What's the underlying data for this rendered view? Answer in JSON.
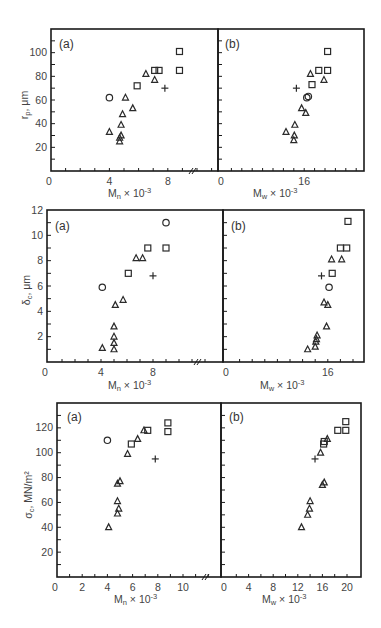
{
  "chart_data": [
    {
      "type": "scatter",
      "row": "top",
      "ylabel": "r_p, μm",
      "ylim": [
        0,
        120
      ],
      "yticks": [
        20,
        40,
        60,
        80,
        100
      ],
      "panels": [
        {
          "label": "(a)",
          "xlabel": "M_n × 10^-3",
          "xlim": [
            0,
            12
          ],
          "xticks": [
            0,
            4,
            8
          ],
          "axis_break": true,
          "points": [
            {
              "x": 4.0,
              "y": 62,
              "marker": "circle"
            },
            {
              "x": 4.0,
              "y": 33,
              "marker": "triangle"
            },
            {
              "x": 4.7,
              "y": 25,
              "marker": "triangle"
            },
            {
              "x": 4.7,
              "y": 28,
              "marker": "triangle"
            },
            {
              "x": 4.8,
              "y": 30,
              "marker": "triangle"
            },
            {
              "x": 4.8,
              "y": 39,
              "marker": "triangle"
            },
            {
              "x": 4.9,
              "y": 48,
              "marker": "triangle"
            },
            {
              "x": 5.1,
              "y": 62,
              "marker": "triangle"
            },
            {
              "x": 5.6,
              "y": 53,
              "marker": "triangle"
            },
            {
              "x": 5.9,
              "y": 72,
              "marker": "square"
            },
            {
              "x": 6.5,
              "y": 82,
              "marker": "triangle"
            },
            {
              "x": 7.1,
              "y": 77,
              "marker": "triangle"
            },
            {
              "x": 7.1,
              "y": 85,
              "marker": "square"
            },
            {
              "x": 7.4,
              "y": 85,
              "marker": "square"
            },
            {
              "x": 7.8,
              "y": 70,
              "marker": "plus"
            },
            {
              "x": 8.8,
              "y": 101,
              "marker": "square"
            },
            {
              "x": 8.8,
              "y": 85,
              "marker": "square"
            }
          ]
        },
        {
          "label": "(b)",
          "xlabel": "M_w × 10^-3",
          "xlim": [
            0,
            24
          ],
          "xticks": [
            0,
            16
          ],
          "points": [
            {
              "x": 12.5,
              "y": 33,
              "marker": "triangle"
            },
            {
              "x": 14.0,
              "y": 26,
              "marker": "triangle"
            },
            {
              "x": 14.1,
              "y": 30,
              "marker": "triangle"
            },
            {
              "x": 14.2,
              "y": 39,
              "marker": "triangle"
            },
            {
              "x": 14.5,
              "y": 70,
              "marker": "plus"
            },
            {
              "x": 15.5,
              "y": 53,
              "marker": "triangle"
            },
            {
              "x": 16.3,
              "y": 49,
              "marker": "triangle"
            },
            {
              "x": 16.5,
              "y": 62,
              "marker": "circle"
            },
            {
              "x": 16.8,
              "y": 63,
              "marker": "circle"
            },
            {
              "x": 17.2,
              "y": 82,
              "marker": "triangle"
            },
            {
              "x": 17.5,
              "y": 73,
              "marker": "square"
            },
            {
              "x": 18.8,
              "y": 85,
              "marker": "square"
            },
            {
              "x": 19.8,
              "y": 77,
              "marker": "triangle"
            },
            {
              "x": 20.5,
              "y": 101,
              "marker": "square"
            },
            {
              "x": 20.5,
              "y": 85,
              "marker": "square"
            }
          ]
        }
      ]
    },
    {
      "type": "scatter",
      "row": "middle",
      "ylabel": "δ_c, μm",
      "ylim": [
        0,
        12
      ],
      "yticks": [
        2,
        4,
        6,
        8,
        10,
        12
      ],
      "panels": [
        {
          "label": "(a)",
          "xlabel": "M_n × 10^-3",
          "xlim": [
            0,
            12
          ],
          "xticks": [
            0,
            4,
            8
          ],
          "axis_break": true,
          "points": [
            {
              "x": 4.1,
              "y": 5.9,
              "marker": "circle"
            },
            {
              "x": 4.1,
              "y": 1.1,
              "marker": "triangle"
            },
            {
              "x": 5.0,
              "y": 1.0,
              "marker": "triangle"
            },
            {
              "x": 5.0,
              "y": 1.5,
              "marker": "triangle"
            },
            {
              "x": 5.0,
              "y": 2.0,
              "marker": "triangle"
            },
            {
              "x": 5.0,
              "y": 2.8,
              "marker": "triangle"
            },
            {
              "x": 5.1,
              "y": 4.5,
              "marker": "triangle"
            },
            {
              "x": 5.7,
              "y": 4.9,
              "marker": "triangle"
            },
            {
              "x": 6.1,
              "y": 7.0,
              "marker": "square"
            },
            {
              "x": 6.7,
              "y": 8.2,
              "marker": "triangle"
            },
            {
              "x": 7.2,
              "y": 8.2,
              "marker": "triangle"
            },
            {
              "x": 7.6,
              "y": 9.0,
              "marker": "square"
            },
            {
              "x": 8.0,
              "y": 6.8,
              "marker": "plus"
            },
            {
              "x": 9.0,
              "y": 9.0,
              "marker": "square"
            },
            {
              "x": 9.0,
              "y": 11.0,
              "marker": "circle"
            }
          ]
        },
        {
          "label": "(b)",
          "xlabel": "M_w × 10^-3",
          "xlim": [
            0,
            22
          ],
          "xticks": [
            0,
            16
          ],
          "points": [
            {
              "x": 12.8,
              "y": 1.0,
              "marker": "triangle"
            },
            {
              "x": 14.0,
              "y": 1.2,
              "marker": "triangle"
            },
            {
              "x": 14.1,
              "y": 1.6,
              "marker": "triangle"
            },
            {
              "x": 14.2,
              "y": 1.8,
              "marker": "triangle"
            },
            {
              "x": 14.3,
              "y": 2.1,
              "marker": "triangle"
            },
            {
              "x": 15.0,
              "y": 6.8,
              "marker": "plus"
            },
            {
              "x": 15.8,
              "y": 2.8,
              "marker": "triangle"
            },
            {
              "x": 15.4,
              "y": 4.7,
              "marker": "triangle"
            },
            {
              "x": 16.0,
              "y": 4.5,
              "marker": "triangle"
            },
            {
              "x": 16.2,
              "y": 5.9,
              "marker": "circle"
            },
            {
              "x": 16.7,
              "y": 7.0,
              "marker": "square"
            },
            {
              "x": 16.6,
              "y": 8.1,
              "marker": "triangle"
            },
            {
              "x": 18.2,
              "y": 8.1,
              "marker": "triangle"
            },
            {
              "x": 18.0,
              "y": 9.0,
              "marker": "square"
            },
            {
              "x": 19.0,
              "y": 9.0,
              "marker": "square"
            },
            {
              "x": 19.2,
              "y": 11.1,
              "marker": "square"
            }
          ]
        }
      ]
    },
    {
      "type": "scatter",
      "row": "bottom",
      "ylabel": "σ_c, MN/m²",
      "ylim": [
        0,
        140
      ],
      "yticks": [
        20,
        40,
        60,
        80,
        100,
        120
      ],
      "panels": [
        {
          "label": "(a)",
          "xlabel": "M_n × 10^-3",
          "xlim": [
            0,
            12.5
          ],
          "xticks": [
            0,
            2,
            4,
            6,
            8,
            10
          ],
          "axis_break": true,
          "points": [
            {
              "x": 4.0,
              "y": 110,
              "marker": "circle"
            },
            {
              "x": 4.1,
              "y": 40,
              "marker": "triangle"
            },
            {
              "x": 4.8,
              "y": 51,
              "marker": "triangle"
            },
            {
              "x": 4.9,
              "y": 55,
              "marker": "triangle"
            },
            {
              "x": 4.8,
              "y": 61,
              "marker": "triangle"
            },
            {
              "x": 4.8,
              "y": 75,
              "marker": "triangle"
            },
            {
              "x": 5.0,
              "y": 77,
              "marker": "triangle"
            },
            {
              "x": 5.6,
              "y": 99,
              "marker": "triangle"
            },
            {
              "x": 5.9,
              "y": 107,
              "marker": "square"
            },
            {
              "x": 6.4,
              "y": 111,
              "marker": "triangle"
            },
            {
              "x": 6.9,
              "y": 118,
              "marker": "triangle"
            },
            {
              "x": 7.2,
              "y": 118,
              "marker": "square"
            },
            {
              "x": 7.8,
              "y": 95,
              "marker": "plus"
            },
            {
              "x": 8.8,
              "y": 124,
              "marker": "square"
            },
            {
              "x": 8.8,
              "y": 117,
              "marker": "square"
            }
          ]
        },
        {
          "label": "(b)",
          "xlabel": "M_w × 10^-3",
          "xlim": [
            0,
            22
          ],
          "xticks": [
            0,
            4,
            8,
            12,
            16,
            20
          ],
          "points": [
            {
              "x": 12.6,
              "y": 40,
              "marker": "triangle"
            },
            {
              "x": 13.6,
              "y": 50,
              "marker": "triangle"
            },
            {
              "x": 13.9,
              "y": 55,
              "marker": "triangle"
            },
            {
              "x": 14.0,
              "y": 61,
              "marker": "triangle"
            },
            {
              "x": 14.8,
              "y": 95,
              "marker": "plus"
            },
            {
              "x": 15.7,
              "y": 100,
              "marker": "triangle"
            },
            {
              "x": 16.0,
              "y": 74,
              "marker": "triangle"
            },
            {
              "x": 16.3,
              "y": 76,
              "marker": "triangle"
            },
            {
              "x": 16.2,
              "y": 107,
              "marker": "square"
            },
            {
              "x": 16.3,
              "y": 109,
              "marker": "square"
            },
            {
              "x": 16.8,
              "y": 111,
              "marker": "triangle"
            },
            {
              "x": 18.5,
              "y": 118,
              "marker": "square"
            },
            {
              "x": 19.8,
              "y": 118,
              "marker": "square"
            },
            {
              "x": 19.8,
              "y": 125,
              "marker": "square"
            }
          ]
        }
      ]
    }
  ],
  "labels": {
    "top_ylabel": "r",
    "top_ylabel_sub": "p",
    "top_ylabel_unit": ", μm",
    "mid_ylabel": "δ",
    "mid_ylabel_sub": "c",
    "mid_ylabel_unit": ", μm",
    "bot_ylabel": "σ",
    "bot_ylabel_sub": "c",
    "bot_ylabel_unit": ", MN/m²",
    "xlabel_a_main": "M",
    "xlabel_a_sub": "n",
    "xlabel_b_main": "M",
    "xlabel_b_sub": "w",
    "xlabel_mult": " × 10",
    "xlabel_exp": "-3",
    "panel_a": "(a)",
    "panel_b": "(b)"
  }
}
